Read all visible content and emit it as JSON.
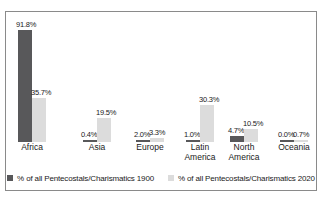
{
  "chart_data": {
    "type": "bar",
    "title": "",
    "subtitle": "",
    "xlabel": "",
    "ylabel": "",
    "ylim": [
      0,
      100
    ],
    "grid": false,
    "legend_position": "bottom",
    "categories": [
      "Africa",
      "Asia",
      "Europe",
      "Latin America",
      "North\nAmerica",
      "Oceania"
    ],
    "series": [
      {
        "name": "% of all Pentecostals/Charismatics 1900",
        "color": "#58585a",
        "values": [
          91.8,
          0.4,
          2.0,
          1.0,
          4.7,
          0.0
        ],
        "labels": [
          "91.8%",
          "0.4%",
          "2.0%",
          "1.0%",
          "4.7%",
          "0.0%"
        ]
      },
      {
        "name": "% of all Pentecostals/Charismatics 2020",
        "color": "#dcdcdc",
        "values": [
          35.7,
          19.5,
          3.3,
          30.3,
          10.5,
          0.7
        ],
        "labels": [
          "35.7%",
          "19.5%",
          "3.3%",
          "30.3%",
          "10.5%",
          "0.7%"
        ]
      }
    ]
  },
  "legend": {
    "items": [
      {
        "label": "% of all Pentecostals/Charismatics 1900",
        "swatch": "legend-swatch-1900"
      },
      {
        "label": "% of all Pentecostals/Charismatics 2020",
        "swatch": "legend-swatch-2020"
      }
    ]
  }
}
